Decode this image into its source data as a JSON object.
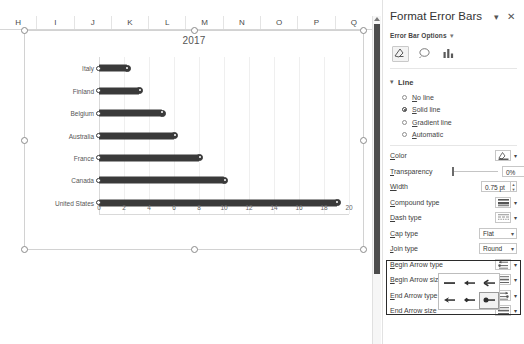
{
  "spreadsheet": {
    "column_headers": [
      "H",
      "I",
      "J",
      "K",
      "L",
      "M",
      "N",
      "O",
      "P",
      "Q"
    ]
  },
  "chart": {
    "title": "2017"
  },
  "chart_data": {
    "type": "bar",
    "orientation": "horizontal",
    "title": "2017",
    "xlabel": "",
    "ylabel": "",
    "categories": [
      "Italy",
      "Finland",
      "Belgium",
      "Australia",
      "France",
      "Canada",
      "United States"
    ],
    "values": [
      2.2,
      3.2,
      5.0,
      6.0,
      8.0,
      10.0,
      19.0
    ],
    "xticks": [
      "0",
      "2",
      "4",
      "6",
      "8",
      "10",
      "12",
      "14",
      "16",
      "18",
      "20"
    ],
    "xlim": [
      0,
      20
    ],
    "grid": true,
    "legend": false,
    "series_color": "#3a3a3a",
    "marker": "circle-cap-both-ends"
  },
  "panel": {
    "title": "Format Error Bars",
    "collapse_icon": "chevron-down-icon",
    "close_icon": "close-icon",
    "subtitle": "Error Bar Options",
    "subtitle_chevron": "chevron-down-icon",
    "icons": [
      {
        "name": "fill-line-icon",
        "selected": true
      },
      {
        "name": "effects-icon",
        "selected": false
      },
      {
        "name": "chart-options-icon",
        "selected": false
      }
    ],
    "line_section": {
      "label": "Line",
      "chevron": "chevron-down-icon",
      "options": [
        {
          "label": "No line",
          "selected": false
        },
        {
          "label": "Solid line",
          "selected": true
        },
        {
          "label": "Gradient line",
          "selected": false
        },
        {
          "label": "Automatic",
          "selected": false
        }
      ]
    },
    "properties": [
      {
        "label": "Color",
        "control": "color-swatch",
        "value": ""
      },
      {
        "label": "Transparency",
        "control": "slider-number",
        "value": "0%"
      },
      {
        "label": "Width",
        "control": "number",
        "value": "0.75 pt"
      },
      {
        "label": "Compound type",
        "control": "gallery",
        "value": ""
      },
      {
        "label": "Dash type",
        "control": "gallery",
        "value": ""
      },
      {
        "label": "Cap type",
        "control": "select",
        "value": "Flat"
      },
      {
        "label": "Join type",
        "control": "select",
        "value": "Round"
      },
      {
        "label": "Begin Arrow type",
        "control": "gallery",
        "value": ""
      },
      {
        "label": "Begin Arrow size",
        "control": "gallery",
        "value": ""
      },
      {
        "label": "End Arrow type",
        "control": "gallery",
        "value": ""
      },
      {
        "label": "End Arrow size",
        "control": "gallery",
        "value": ""
      }
    ],
    "arrow_flyout": {
      "options": [
        {
          "name": "arrow-none",
          "selected": false
        },
        {
          "name": "arrow-triangle",
          "selected": false
        },
        {
          "name": "arrow-open",
          "selected": false
        },
        {
          "name": "arrow-stealth",
          "selected": false
        },
        {
          "name": "arrow-diamond",
          "selected": false
        },
        {
          "name": "arrow-oval",
          "selected": true
        }
      ]
    }
  }
}
